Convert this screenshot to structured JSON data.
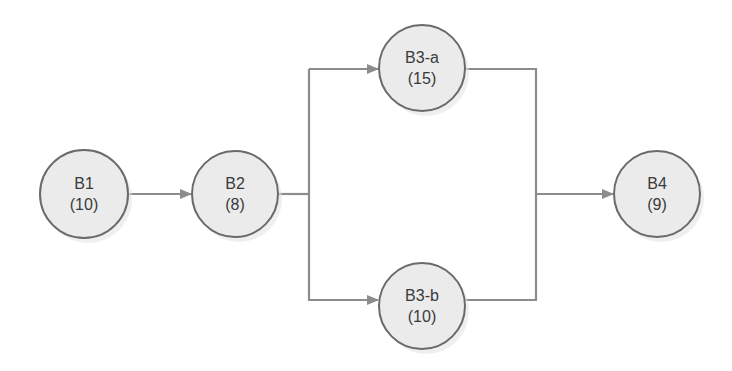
{
  "diagram": {
    "type": "flow-network",
    "colors": {
      "node_fill": "#ebebeb",
      "node_stroke": "#6a6a6a",
      "edge": "#8c8c8c",
      "text": "#3a3a3a",
      "background": "#ffffff"
    },
    "nodes": [
      {
        "id": "B1",
        "name": "B1",
        "value": "(10)",
        "cx": 84,
        "cy": 194
      },
      {
        "id": "B2",
        "name": "B2",
        "value": "(8)",
        "cx": 235,
        "cy": 194
      },
      {
        "id": "B3-a",
        "name": "B3-a",
        "value": "(15)",
        "cx": 422,
        "cy": 68
      },
      {
        "id": "B3-b",
        "name": "B3-b",
        "value": "(10)",
        "cx": 422,
        "cy": 306
      },
      {
        "id": "B4",
        "name": "B4",
        "value": "(9)",
        "cx": 657,
        "cy": 194
      }
    ],
    "edges": [
      {
        "from": "B1",
        "to": "B2"
      },
      {
        "from": "B2",
        "to": "B3-a"
      },
      {
        "from": "B2",
        "to": "B3-b"
      },
      {
        "from": "B3-a",
        "to": "B4"
      },
      {
        "from": "B3-b",
        "to": "B4"
      }
    ]
  }
}
